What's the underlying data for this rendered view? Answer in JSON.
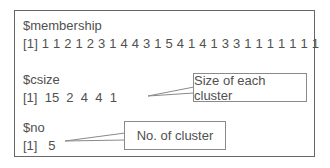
{
  "console": {
    "membership_label": "$membership",
    "membership_values": "[1] 1 1 2 1 2 3 1 4 4 3 1 5 4 1 4 1 3 3 1 1 1 1 1 1 1",
    "csize_label": "$csize",
    "csize_values": "[1]  15  2  4  4  1",
    "no_label": "$no",
    "no_values": "[1]   5"
  },
  "callouts": {
    "size_of_each_cluster": "Size of each cluster",
    "no_of_cluster": "No. of cluster"
  },
  "colors": {
    "border": "#666666",
    "text": "#505050",
    "callout_border": "#8a8a8a"
  }
}
